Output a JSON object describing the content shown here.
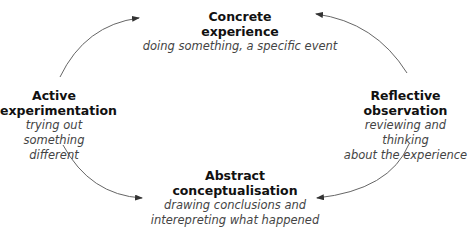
{
  "diagram": {
    "type": "cycle",
    "nodes": [
      {
        "id": "concrete",
        "title_line1": "Concrete",
        "title_line2": "experience",
        "desc_line1": "doing something, a specific event",
        "desc_line2": ""
      },
      {
        "id": "reflective",
        "title_line1": "Reflective",
        "title_line2": "observation",
        "desc_line1": "reviewing and thinking",
        "desc_line2": "about the experience"
      },
      {
        "id": "abstract",
        "title_line1": "Abstract",
        "title_line2": "conceptualisation",
        "desc_line1": "drawing conclusions and",
        "desc_line2": "interepreting what happened"
      },
      {
        "id": "active",
        "title_line1": "Active",
        "title_line2": "experimentation",
        "desc_line1": "trying out",
        "desc_line2": "something different"
      }
    ],
    "edges": [
      {
        "from": "concrete",
        "to": "reflective"
      },
      {
        "from": "reflective",
        "to": "abstract"
      },
      {
        "from": "abstract",
        "to": "active"
      },
      {
        "from": "active",
        "to": "concrete"
      }
    ],
    "colors": {
      "arrow": "#555555",
      "title": "#111111",
      "desc": "#444444",
      "background": "#ffffff"
    }
  }
}
